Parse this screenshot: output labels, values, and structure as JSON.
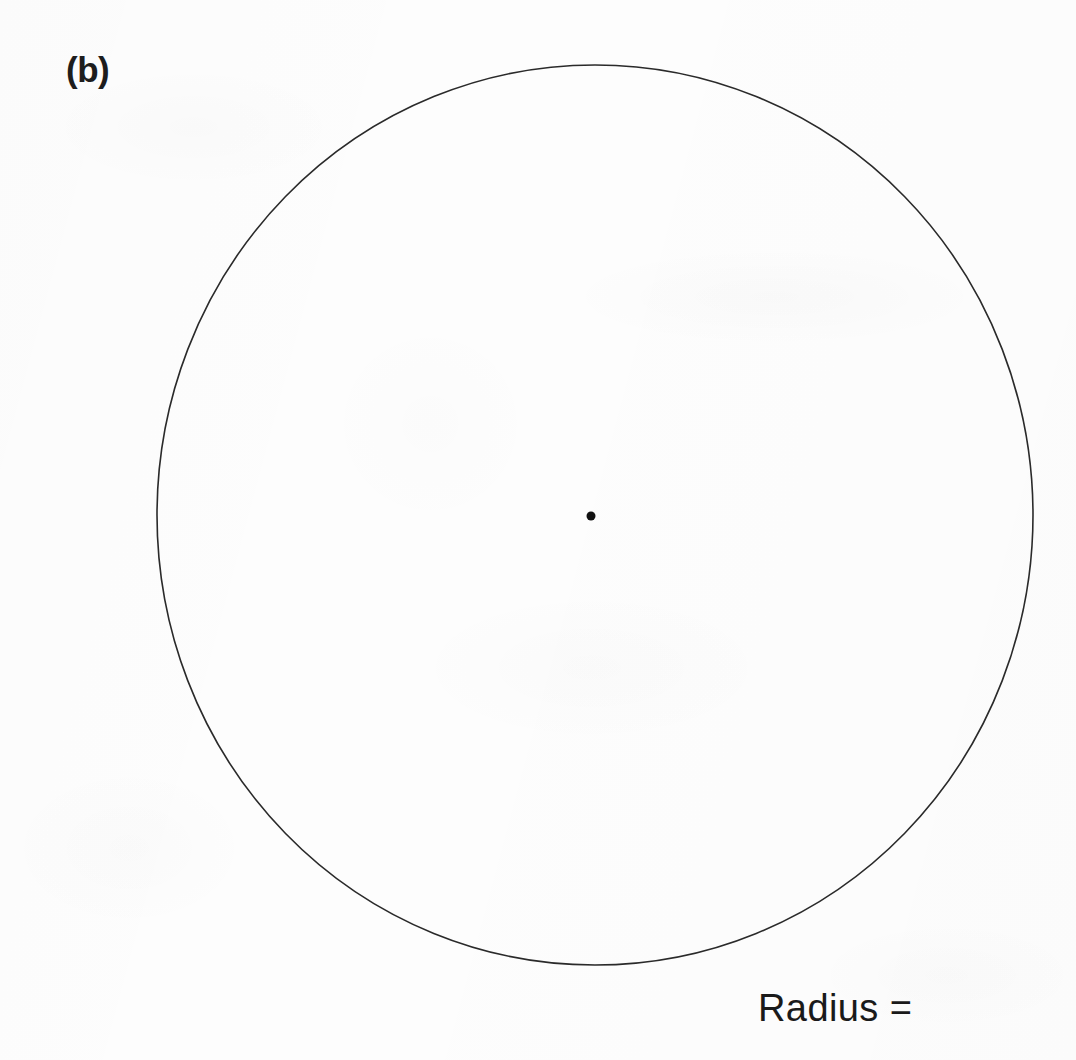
{
  "figure": {
    "panel_label": "(b)",
    "caption": "Radius =",
    "background_color": "#fdfdfd",
    "ink_color": "#2a2a2a"
  },
  "diagram_data": {
    "type": "geometry-diagram",
    "subject": "circle with marked center",
    "shapes": [
      {
        "name": "circle-outline",
        "kind": "circle",
        "center_x": 595,
        "center_y": 515,
        "radius_x": 438,
        "radius_y": 450,
        "stroke_color": "#2a2a2a",
        "stroke_width": 1.6,
        "fill": "none"
      },
      {
        "name": "center-point",
        "kind": "dot",
        "center_x": 591,
        "center_y": 516,
        "radius": 4.5,
        "fill": "#111111"
      }
    ],
    "labels": [
      {
        "name": "panel-label",
        "text": "(b)",
        "x": 70,
        "y": 62
      },
      {
        "name": "radius-label",
        "text": "Radius =",
        "x": 760,
        "y": 1025
      }
    ],
    "answer_blank": true
  }
}
